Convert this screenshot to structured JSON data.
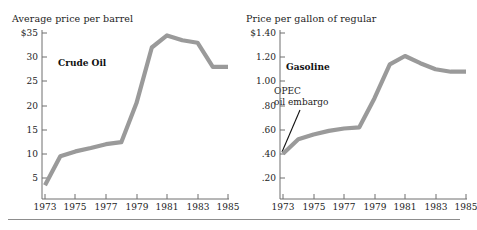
{
  "figure": {
    "background": "#ffffff",
    "series_color": "#9a9a9a",
    "axis_color": "#6f6f6f",
    "text_color": "#232323",
    "annotation_line_color": "#111111",
    "footer_rule_color": "#8d8d8d"
  },
  "chart_data": [
    {
      "id": "crude-oil",
      "type": "line",
      "title": "Average price per barrel",
      "series_label": "Crude Oil",
      "xlabel": "",
      "ylabel": "",
      "grid": false,
      "legend_position": "inline-label",
      "x": [
        1973,
        1974,
        1975,
        1976,
        1977,
        1978,
        1979,
        1980,
        1981,
        1982,
        1983,
        1984,
        1985
      ],
      "values": [
        3.5,
        9.5,
        10.5,
        11.2,
        12.0,
        12.4,
        20.5,
        32.0,
        34.5,
        33.5,
        33.0,
        28.0,
        28.0
      ],
      "xlim": [
        1973,
        1985
      ],
      "ylim": [
        0,
        35
      ],
      "ytick_values": [
        35,
        30,
        25,
        20,
        15,
        10,
        5
      ],
      "ytick_labels": [
        "$35",
        "30",
        "25",
        "20",
        "15",
        "10",
        "5"
      ],
      "xtick_values": [
        1973,
        1975,
        1977,
        1979,
        1981,
        1983,
        1985
      ],
      "xtick_labels": [
        "1973",
        "1975",
        "1977",
        "1979",
        "1981",
        "1983",
        "1985"
      ],
      "annotations": []
    },
    {
      "id": "gasoline",
      "type": "line",
      "title": "Price per gallon of regular",
      "series_label": "Gasoline",
      "xlabel": "",
      "ylabel": "",
      "grid": false,
      "legend_position": "inline-label",
      "x": [
        1973,
        1974,
        1975,
        1976,
        1977,
        1978,
        1979,
        1980,
        1981,
        1982,
        1983,
        1984,
        1985
      ],
      "values": [
        0.4,
        0.52,
        0.56,
        0.59,
        0.61,
        0.62,
        0.86,
        1.14,
        1.21,
        1.15,
        1.1,
        1.08,
        1.08
      ],
      "xlim": [
        1973,
        1985
      ],
      "ylim": [
        0,
        1.4
      ],
      "ytick_values": [
        1.4,
        1.2,
        1.0,
        0.8,
        0.6,
        0.4,
        0.2
      ],
      "ytick_labels": [
        "$1.40",
        "1.20",
        "1.00",
        ".80",
        ".60",
        ".40",
        ".20"
      ],
      "xtick_values": [
        1973,
        1975,
        1977,
        1979,
        1981,
        1983,
        1985
      ],
      "xtick_labels": [
        "1973",
        "1975",
        "1977",
        "1979",
        "1981",
        "1983",
        "1985"
      ],
      "annotations": [
        {
          "id": "opec-embargo",
          "line1": "OPEC",
          "line2": "oil embargo",
          "points_to_year": 1973,
          "points_to_value": 0.4
        }
      ]
    }
  ]
}
